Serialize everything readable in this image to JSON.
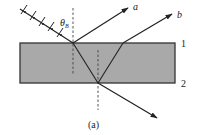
{
  "figure": {
    "caption": "(a)",
    "angle_label": "θ",
    "angle_subscript": "B",
    "ray_labels": {
      "reflected": "a",
      "transmitted": "b"
    },
    "interface_labels": {
      "top": "1",
      "bottom": "2"
    }
  },
  "colors": {
    "slab_fill": "#a9a9a9",
    "slab_border": "#333333",
    "ray": "#222222",
    "normal": "#444444",
    "background": "#ffffff"
  },
  "geometry": {
    "slab": {
      "x": 20,
      "y": 43,
      "width": 155,
      "height": 40
    },
    "incident_point": {
      "x": 73,
      "y": 43
    },
    "bottom_point": {
      "x": 98,
      "y": 83
    },
    "exit_point_top": {
      "x": 123,
      "y": 43
    }
  }
}
